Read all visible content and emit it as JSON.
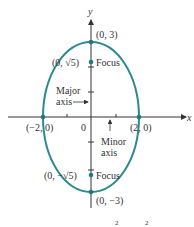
{
  "figure": {
    "type": "ellipse-diagram",
    "colors": {
      "curve": "#2a8a8e",
      "axis": "#333333",
      "point": "#1f7a7c",
      "text": "#333333"
    },
    "axes": {
      "x_label": "x",
      "y_label": "y",
      "origin_label": "0"
    },
    "ellipse": {
      "center": [
        0,
        0
      ],
      "semi_major": 3,
      "semi_minor": 2,
      "orientation": "vertical"
    },
    "points": [
      {
        "id": "top-vertex",
        "label": "(0, 3)",
        "x": 0,
        "y": 3
      },
      {
        "id": "top-focus",
        "label": "(0, √5)",
        "x": 0,
        "y": 2.236,
        "tag": "Focus"
      },
      {
        "id": "left-vertex",
        "label": "(−2, 0)",
        "x": -2,
        "y": 0
      },
      {
        "id": "right-vertex",
        "label": "(2, 0)",
        "x": 2,
        "y": 0
      },
      {
        "id": "bottom-focus",
        "label": "(0, −√5)",
        "x": 0,
        "y": -2.236,
        "tag": "Focus"
      },
      {
        "id": "bottom-vertex",
        "label": "(0, −3)",
        "x": 0,
        "y": -3
      }
    ],
    "annotations": {
      "major_axis_line1": "Major",
      "major_axis_line2": "axis",
      "minor_axis_line1": "Minor",
      "minor_axis_line2": "axis",
      "focus_top": "Focus",
      "focus_bottom": "Focus"
    },
    "caption_fragment": {
      "exp1": "2",
      "exp2": "2"
    }
  }
}
